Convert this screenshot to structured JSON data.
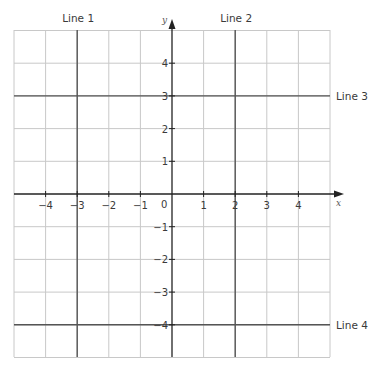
{
  "diagram": {
    "type": "coordinate-grid",
    "x_range": [
      -5,
      5
    ],
    "y_range": [
      -5,
      5
    ],
    "axes": {
      "x_label": "x",
      "y_label": "y",
      "origin_label": "0"
    },
    "x_ticks": [
      "-4",
      "-3",
      "-2",
      "-1",
      "1",
      "2",
      "3",
      "4"
    ],
    "y_ticks": [
      "4",
      "3",
      "2",
      "1",
      "-1",
      "-2",
      "-3",
      "-4"
    ],
    "lines": [
      {
        "name": "Line 1",
        "equation": "x = -3",
        "orientation": "vertical"
      },
      {
        "name": "Line 2",
        "equation": "x = 2",
        "orientation": "vertical"
      },
      {
        "name": "Line 3",
        "equation": "y = 3",
        "orientation": "horizontal"
      },
      {
        "name": "Line 4",
        "equation": "y = -4",
        "orientation": "horizontal"
      }
    ],
    "colors": {
      "grid": "#c8c8c8",
      "axis": "#222222",
      "line": "#555555",
      "text": "#3a3a3a"
    }
  }
}
